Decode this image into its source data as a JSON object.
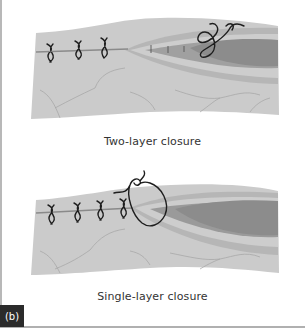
{
  "figure": {
    "panel_label": "(b)",
    "panels": [
      {
        "id": "two-layer",
        "caption": "Two-layer closure",
        "interrupted_sutures": 3,
        "deep_layer_tick_marks": 3
      },
      {
        "id": "single-layer",
        "caption": "Single-layer closure",
        "interrupted_sutures": 4
      }
    ]
  },
  "colors": {
    "skin": "#c9c9c9",
    "skin_light": "#d8d8d8",
    "outer_layer": "#b3b3b3",
    "inner_band": "#cfcfcf",
    "muscle": "#8f8f8f",
    "wound_line": "#8a8a8a",
    "suture": "#1e1e1e",
    "vessel": "#a6a6a6",
    "label_bg": "#2b2b2b"
  }
}
